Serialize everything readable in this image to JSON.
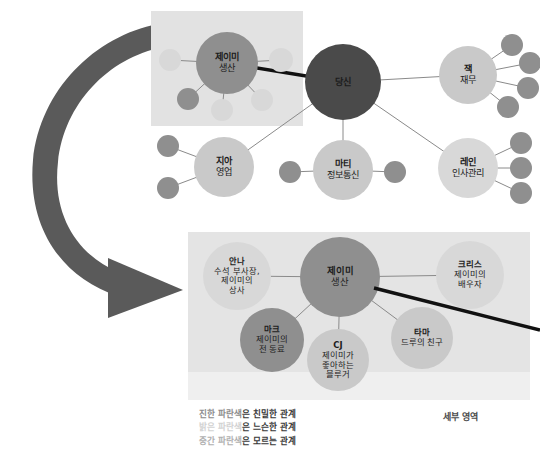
{
  "figure": {
    "type": "network-diagram",
    "title_visible": false,
    "detail_caption": "세부 영역",
    "palette": {
      "background": "#ffffff",
      "arrow": "#5a5a5a",
      "highlight_box": "#e2e2e2",
      "detail_panel_top": "#e4e4e4",
      "detail_panel_bottom": "#efefef",
      "node_dark": "#4a4a4a",
      "node_mid": "#8f8f8f",
      "node_light": "#c9c9c9",
      "node_lighter": "#d8d8d8",
      "edge_thin": "#8a8a8a",
      "edge_thick": "#111111",
      "label_text": "#1c1c1c"
    }
  },
  "overview_network": {
    "name": "overview-network",
    "highlight_box": {
      "x": 151,
      "y": 11,
      "w": 152,
      "h": 115
    },
    "nodes": [
      {
        "id": "jamie",
        "name": "제이미",
        "role": "생산",
        "cx": 227,
        "cy": 63,
        "r": 31,
        "tone": "mid",
        "font": 9.2,
        "labeled": true
      },
      {
        "id": "you",
        "name": "당신",
        "role": "",
        "cx": 343,
        "cy": 82,
        "r": 38,
        "tone": "dark",
        "font": 9.2,
        "labeled": true
      },
      {
        "id": "jack",
        "name": "잭",
        "role": "재무",
        "cx": 468,
        "cy": 75,
        "r": 29,
        "tone": "light",
        "font": 9.2,
        "labeled": true
      },
      {
        "id": "jia",
        "name": "지아",
        "role": "영업",
        "cx": 224,
        "cy": 167,
        "r": 30,
        "tone": "light",
        "font": 9.2,
        "labeled": true
      },
      {
        "id": "marty",
        "name": "마티",
        "role": "정보통신",
        "cx": 343,
        "cy": 170,
        "r": 30,
        "tone": "light",
        "font": 9.2,
        "labeled": true
      },
      {
        "id": "lane",
        "name": "레인",
        "role": "인사관리",
        "cx": 468,
        "cy": 168,
        "r": 30,
        "tone": "lighter",
        "font": 9.2,
        "labeled": true
      },
      {
        "id": "j-s1",
        "cx": 170,
        "cy": 60,
        "r": 11,
        "tone": "lighter",
        "labeled": false
      },
      {
        "id": "j-s2",
        "cx": 281,
        "cy": 60,
        "r": 12,
        "tone": "lighter",
        "labeled": false
      },
      {
        "id": "j-s3",
        "cx": 188,
        "cy": 99,
        "r": 11,
        "tone": "mid",
        "labeled": false
      },
      {
        "id": "j-s4",
        "cx": 222,
        "cy": 110,
        "r": 11,
        "tone": "lighter",
        "labeled": false
      },
      {
        "id": "j-s5",
        "cx": 262,
        "cy": 100,
        "r": 11,
        "tone": "lighter",
        "labeled": false
      },
      {
        "id": "k-s1",
        "cx": 512,
        "cy": 45,
        "r": 11,
        "tone": "mid",
        "labeled": false
      },
      {
        "id": "k-s2",
        "cx": 530,
        "cy": 63,
        "r": 11,
        "tone": "mid",
        "labeled": false
      },
      {
        "id": "k-s3",
        "cx": 528,
        "cy": 88,
        "r": 11,
        "tone": "mid",
        "labeled": false
      },
      {
        "id": "k-s4",
        "cx": 508,
        "cy": 107,
        "r": 11,
        "tone": "mid",
        "labeled": false
      },
      {
        "id": "g-s1",
        "cx": 168,
        "cy": 146,
        "r": 11,
        "tone": "mid",
        "labeled": false
      },
      {
        "id": "g-s2",
        "cx": 168,
        "cy": 188,
        "r": 11,
        "tone": "mid",
        "labeled": false
      },
      {
        "id": "m-s1",
        "cx": 290,
        "cy": 172,
        "r": 11,
        "tone": "mid",
        "labeled": false
      },
      {
        "id": "m-s2",
        "cx": 395,
        "cy": 172,
        "r": 11,
        "tone": "mid",
        "labeled": false
      },
      {
        "id": "l-s1",
        "cx": 521,
        "cy": 143,
        "r": 11,
        "tone": "mid",
        "labeled": false
      },
      {
        "id": "l-s2",
        "cx": 521,
        "cy": 168,
        "r": 11,
        "tone": "mid",
        "labeled": false
      },
      {
        "id": "l-s3",
        "cx": 521,
        "cy": 193,
        "r": 11,
        "tone": "mid",
        "labeled": false
      }
    ],
    "edges": [
      {
        "from": "jamie",
        "to": "you",
        "weight": "thick"
      },
      {
        "from": "you",
        "to": "jack",
        "weight": "thin"
      },
      {
        "from": "you",
        "to": "jia",
        "weight": "thin"
      },
      {
        "from": "you",
        "to": "marty",
        "weight": "thin"
      },
      {
        "from": "you",
        "to": "lane",
        "weight": "thin"
      },
      {
        "from": "jamie",
        "to": "j-s1",
        "weight": "thin"
      },
      {
        "from": "jamie",
        "to": "j-s2",
        "weight": "thin"
      },
      {
        "from": "jamie",
        "to": "j-s3",
        "weight": "thin"
      },
      {
        "from": "jamie",
        "to": "j-s4",
        "weight": "thin"
      },
      {
        "from": "jamie",
        "to": "j-s5",
        "weight": "thin"
      },
      {
        "from": "jack",
        "to": "k-s1",
        "weight": "thin"
      },
      {
        "from": "jack",
        "to": "k-s2",
        "weight": "thin"
      },
      {
        "from": "jack",
        "to": "k-s3",
        "weight": "thin"
      },
      {
        "from": "jack",
        "to": "k-s4",
        "weight": "thin"
      },
      {
        "from": "jia",
        "to": "g-s1",
        "weight": "thin"
      },
      {
        "from": "jia",
        "to": "g-s2",
        "weight": "thin"
      },
      {
        "from": "marty",
        "to": "m-s1",
        "weight": "thin"
      },
      {
        "from": "marty",
        "to": "m-s2",
        "weight": "thin"
      },
      {
        "from": "lane",
        "to": "l-s1",
        "weight": "thin"
      },
      {
        "from": "lane",
        "to": "l-s2",
        "weight": "thin"
      },
      {
        "from": "lane",
        "to": "l-s3",
        "weight": "thin"
      }
    ]
  },
  "detail_network": {
    "name": "detail-network",
    "panel": {
      "x": 188,
      "y": 232,
      "w": 342,
      "h": 168
    },
    "nodes": [
      {
        "id": "d-anna",
        "name": "안나",
        "role": "수석 부사장,\n제이미의\n상사",
        "cx": 237,
        "cy": 276,
        "r": 34,
        "tone": "lighter",
        "font": 8.2,
        "labeled": true
      },
      {
        "id": "d-jamie",
        "name": "제이미",
        "role": "생산",
        "cx": 340,
        "cy": 277,
        "r": 40,
        "tone": "mid",
        "font": 9.4,
        "labeled": true
      },
      {
        "id": "d-chris",
        "name": "크리스",
        "role": "제이미의\n배우자",
        "cx": 470,
        "cy": 275,
        "r": 34,
        "tone": "lighter",
        "font": 8.4,
        "labeled": true
      },
      {
        "id": "d-mark",
        "name": "마크",
        "role": "제이미의\n전 동료",
        "cx": 272,
        "cy": 340,
        "r": 32,
        "tone": "mid",
        "font": 8.4,
        "labeled": true
      },
      {
        "id": "d-cj",
        "name": "CJ",
        "role": "제이미가\n좋아하는\n블루거",
        "cx": 338,
        "cy": 360,
        "r": 31,
        "tone": "light",
        "font": 8.4,
        "labeled": true
      },
      {
        "id": "d-tama",
        "name": "타마",
        "role": "드루의 친구",
        "cx": 422,
        "cy": 338,
        "r": 31,
        "tone": "light",
        "font": 8.4,
        "labeled": true
      }
    ],
    "edges": [
      {
        "from": "d-jamie",
        "to": "d-anna",
        "weight": "thin"
      },
      {
        "from": "d-jamie",
        "to": "d-chris",
        "weight": "thin"
      },
      {
        "from": "d-jamie",
        "to": "d-mark",
        "weight": "thin"
      },
      {
        "from": "d-jamie",
        "to": "d-cj",
        "weight": "thin"
      },
      {
        "from": "d-jamie",
        "to": "d-tama",
        "weight": "thin"
      }
    ],
    "outgoing_thick_edge": {
      "x1": 374,
      "y1": 288,
      "x2": 540,
      "y2": 330
    },
    "caption": "세부 영역"
  },
  "legend": {
    "name": "relationship-legend",
    "items": [
      {
        "color_word": "진한 파란색",
        "tone": "dark",
        "rest": "은 친밀한 관계"
      },
      {
        "color_word": "밝은 파란색",
        "tone": "light",
        "rest": "은 느슨한 관계"
      },
      {
        "color_word": "중간 파란색",
        "tone": "mid",
        "rest": "은 모르는 관계"
      }
    ]
  },
  "arrow": {
    "name": "curved-transition-arrow",
    "description": "large C-shaped curved arrow sweeping from upper-right around the left down to the detail panel",
    "color": "#5a5a5a"
  }
}
